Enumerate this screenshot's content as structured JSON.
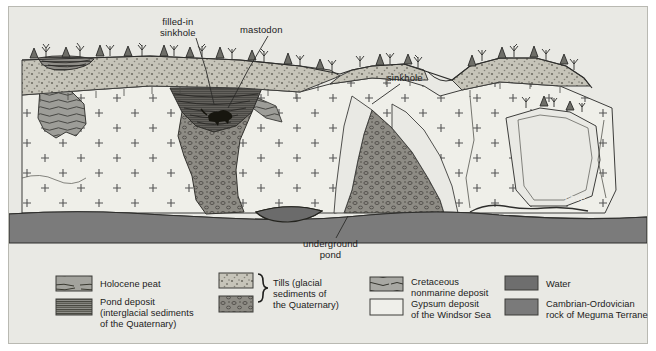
{
  "figure": {
    "type": "geological-cross-section",
    "background_color": "#e9e9e4",
    "frame_border_color": "#b9b9b2"
  },
  "annotations": {
    "filled_in_sinkhole": "filled-in\nsinkhole",
    "mastodon": "mastodon",
    "sinkhole": "sinkhole",
    "underground_pond": "underground\npond",
    "cave": "cave"
  },
  "legend": {
    "columns": [
      {
        "items": [
          {
            "label": "Holocene peat",
            "pattern": "peat-lines",
            "color": "#9d9d9d"
          },
          {
            "label": "Pond deposit\n(interglacial sediments\nof the Quaternary)",
            "pattern": "pond-lines",
            "color": "#8f8f8f"
          }
        ]
      },
      {
        "bracket_label": "Tills (glacial\nsediments of\nthe Quaternary)",
        "items": [
          {
            "label": "",
            "pattern": "till-upper",
            "color": "#c9c7bd"
          },
          {
            "label": "",
            "pattern": "till-lower",
            "color": "#8b8983"
          }
        ]
      },
      {
        "items": [
          {
            "label": "Cretaceous\nnonmarine deposit",
            "pattern": "cretaceous-wavy",
            "color": "#a8a8a3"
          },
          {
            "label": "Gypsum deposit\nof the Windsor Sea",
            "pattern": "gypsum-plain",
            "color": "#eeeeea"
          }
        ]
      },
      {
        "items": [
          {
            "label": "Water",
            "pattern": "solid",
            "color": "#6e6e6e"
          },
          {
            "label": "Cambrian-Ordovician\nrock of Meguma Terrane",
            "pattern": "solid",
            "color": "#7a7a7a"
          }
        ]
      }
    ]
  },
  "units": {
    "gypsum": {
      "name": "Gypsum deposit of the Windsor Sea",
      "fill": "#efefe9",
      "symbol": "plus-cross"
    },
    "till": {
      "name": "Till (glacial sediments of the Quaternary)",
      "fill": "#b9b7ad"
    },
    "till_lower": {
      "name": "Lower till",
      "fill": "#8e8c85"
    },
    "cretaceous": {
      "name": "Cretaceous nonmarine deposit",
      "fill": "#9d9d98"
    },
    "pond_deposit": {
      "name": "Pond deposit",
      "fill": "#6f6f6c"
    },
    "peat": {
      "name": "Holocene peat",
      "fill": "#8a8a86"
    },
    "bedrock": {
      "name": "Cambrian-Ordovician rock of Meguma Terrane",
      "fill": "#7b7b7b"
    },
    "water": {
      "name": "Water",
      "fill": "#6b6b6b"
    }
  }
}
